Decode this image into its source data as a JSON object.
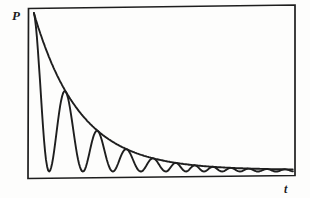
{
  "figure": {
    "kind": "textbook line figure, black ink on white",
    "background_color": "#fdfdfc",
    "ink_color": "#1e1e1e"
  },
  "chart_data": {
    "type": "line",
    "title": "",
    "xlabel": "t",
    "ylabel": "P",
    "x_ticks": [],
    "y_ticks": [],
    "grid": false,
    "legend": "none",
    "frame": "closed rectangular box, no tick marks",
    "units_note": "t and P expressed as 0-1 fractions of the plot box; no numeric scale is shown in the figure",
    "series": [
      {
        "name": "upper envelope (exponential decay)",
        "model": "P(t) = P_inf + (P0 - P_inf) * exp(-(t - t_start) / tau)",
        "params": {
          "P0": 0.971,
          "P_inf": 0.047,
          "tau": 0.172,
          "t_start": 0.022,
          "t_end": 0.992
        }
      },
      {
        "name": "oscillating curve",
        "model": "P(t) = P_min + (envelope(t) - P_min) * cos^2(theta(t)); theta advances by pi/2 between consecutive extrema; maxima tangent to envelope, minima near the t-axis",
        "params": {
          "P_min": 0.038,
          "t_start": 0.022,
          "t_end": 0.992
        },
        "minima_t": [
          0.079,
          0.206,
          0.318,
          0.423,
          0.517,
          0.592,
          0.659,
          0.727,
          0.794,
          0.861,
          0.929
        ]
      }
    ]
  }
}
